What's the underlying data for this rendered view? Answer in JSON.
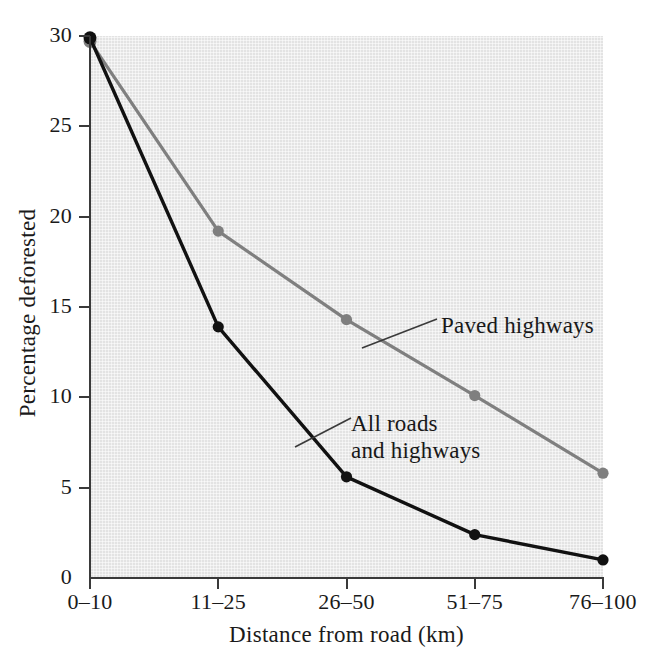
{
  "chart_data": {
    "type": "line",
    "title": "",
    "subtitle": "",
    "xlabel": "Distance from road (km)",
    "ylabel": "Percentage deforested",
    "categories": [
      "0–10",
      "11–25",
      "26–50",
      "51–75",
      "76–100"
    ],
    "yticks": [
      0,
      5,
      10,
      15,
      20,
      25,
      30
    ],
    "ytick_labels": [
      "0",
      "5",
      "10",
      "15",
      "20",
      "25",
      "30"
    ],
    "ylim": [
      0,
      30
    ],
    "grid": false,
    "legend_position": "inline-annotations",
    "series": [
      {
        "name": "Paved highways",
        "color": "#7f7f7f",
        "values": [
          29.7,
          19.2,
          14.3,
          10.1,
          5.8
        ]
      },
      {
        "name": "All roads and highways",
        "color": "#111111",
        "values": [
          29.9,
          13.9,
          5.6,
          2.4,
          1.0
        ]
      }
    ],
    "annotations": [
      {
        "text": "Paved highways",
        "series": "Paved highways"
      },
      {
        "text": "All roads\nand highways",
        "series": "All roads and highways"
      }
    ],
    "plot_background": "#e3e3e3",
    "axis_color": "#3a3a3a"
  }
}
